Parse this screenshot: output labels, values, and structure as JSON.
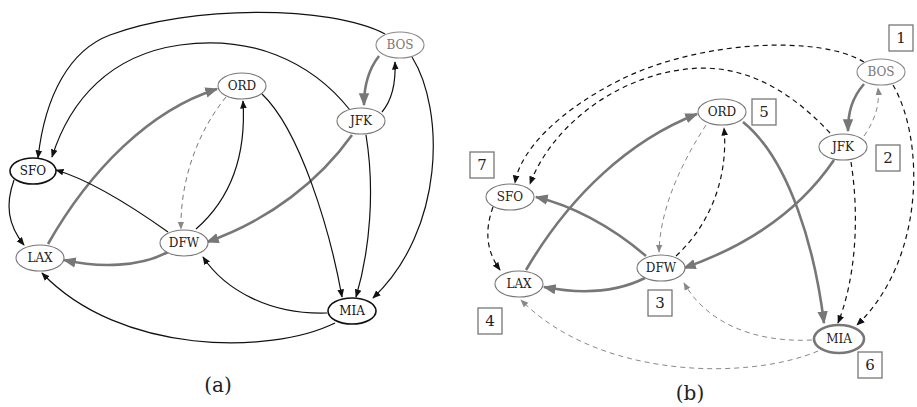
{
  "figure": {
    "panels": [
      {
        "caption": "(a)",
        "nodes": [
          {
            "id": "BOS",
            "label": "BOS"
          },
          {
            "id": "ORD",
            "label": "ORD"
          },
          {
            "id": "JFK",
            "label": "JFK"
          },
          {
            "id": "SFO",
            "label": "SFO"
          },
          {
            "id": "DFW",
            "label": "DFW"
          },
          {
            "id": "LAX",
            "label": "LAX"
          },
          {
            "id": "MIA",
            "label": "MIA"
          }
        ],
        "edges": [
          {
            "from": "BOS",
            "to": "SFO",
            "style": "solid"
          },
          {
            "from": "JFK",
            "to": "SFO",
            "style": "solid"
          },
          {
            "from": "BOS",
            "to": "JFK",
            "style": "thick-gray"
          },
          {
            "from": "JFK",
            "to": "BOS",
            "style": "solid"
          },
          {
            "from": "BOS",
            "to": "MIA",
            "style": "solid"
          },
          {
            "from": "JFK",
            "to": "MIA",
            "style": "solid"
          },
          {
            "from": "JFK",
            "to": "DFW",
            "style": "thick-gray"
          },
          {
            "from": "ORD",
            "to": "DFW",
            "style": "dashed"
          },
          {
            "from": "DFW",
            "to": "ORD",
            "style": "solid"
          },
          {
            "from": "ORD",
            "to": "MIA",
            "style": "solid"
          },
          {
            "from": "LAX",
            "to": "ORD",
            "style": "thick-gray"
          },
          {
            "from": "DFW",
            "to": "SFO",
            "style": "solid"
          },
          {
            "from": "DFW",
            "to": "LAX",
            "style": "thick-gray"
          },
          {
            "from": "SFO",
            "to": "LAX",
            "style": "solid"
          },
          {
            "from": "MIA",
            "to": "DFW",
            "style": "solid"
          },
          {
            "from": "MIA",
            "to": "LAX",
            "style": "solid"
          }
        ]
      },
      {
        "caption": "(b)",
        "nodes": [
          {
            "id": "BOS",
            "label": "BOS",
            "order": "1"
          },
          {
            "id": "JFK",
            "label": "JFK",
            "order": "2"
          },
          {
            "id": "DFW",
            "label": "DFW",
            "order": "3"
          },
          {
            "id": "LAX",
            "label": "LAX",
            "order": "4"
          },
          {
            "id": "ORD",
            "label": "ORD",
            "order": "5"
          },
          {
            "id": "MIA",
            "label": "MIA",
            "order": "6"
          },
          {
            "id": "SFO",
            "label": "SFO",
            "order": "7"
          }
        ],
        "edges": [
          {
            "from": "BOS",
            "to": "SFO",
            "style": "dashed"
          },
          {
            "from": "JFK",
            "to": "SFO",
            "style": "dashed"
          },
          {
            "from": "BOS",
            "to": "JFK",
            "style": "thick-gray"
          },
          {
            "from": "JFK",
            "to": "BOS",
            "style": "dashed-gray"
          },
          {
            "from": "BOS",
            "to": "MIA",
            "style": "dashed"
          },
          {
            "from": "JFK",
            "to": "MIA",
            "style": "dashed"
          },
          {
            "from": "JFK",
            "to": "DFW",
            "style": "thick-gray"
          },
          {
            "from": "ORD",
            "to": "DFW",
            "style": "dashed-gray"
          },
          {
            "from": "DFW",
            "to": "ORD",
            "style": "dashed"
          },
          {
            "from": "ORD",
            "to": "MIA",
            "style": "thick-gray"
          },
          {
            "from": "LAX",
            "to": "ORD",
            "style": "thick-gray"
          },
          {
            "from": "DFW",
            "to": "SFO",
            "style": "thick-gray"
          },
          {
            "from": "DFW",
            "to": "LAX",
            "style": "thick-gray"
          },
          {
            "from": "SFO",
            "to": "LAX",
            "style": "dashed"
          },
          {
            "from": "MIA",
            "to": "DFW",
            "style": "dashed-gray"
          },
          {
            "from": "MIA",
            "to": "LAX",
            "style": "dashed-gray"
          }
        ]
      }
    ]
  }
}
